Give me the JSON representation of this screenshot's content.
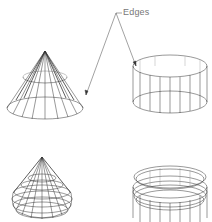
{
  "callout": {
    "label": "Edges",
    "color": "#777777"
  },
  "figures": [
    {
      "id": "cone-edges",
      "shape": "cone",
      "style": "edges-only",
      "position": "top-left"
    },
    {
      "id": "cylinder-edges",
      "shape": "cylinder",
      "style": "edges-only",
      "position": "top-right"
    },
    {
      "id": "cone-smoothed",
      "shape": "cone",
      "style": "wireframe-smoothed",
      "position": "bottom-left"
    },
    {
      "id": "cylinder-smoothed",
      "shape": "cylinder",
      "style": "wireframe-smoothed",
      "position": "bottom-right"
    }
  ],
  "colors": {
    "line": "#333333",
    "background": "#ffffff"
  }
}
